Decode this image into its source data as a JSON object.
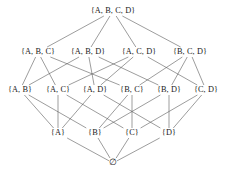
{
  "figure": {
    "background_color": "#ffffff",
    "line_color": "#5a5a5a",
    "text_color": "#1a1a1a",
    "width": 226,
    "height": 172
  },
  "chart_data": {
    "type": "diagram",
    "subtype": "hasse-lattice",
    "base_set": [
      "A",
      "B",
      "C",
      "D"
    ],
    "levels": [
      {
        "rank": 4,
        "y": 11,
        "labels": [
          "{A, B, C, D}"
        ]
      },
      {
        "rank": 3,
        "y": 52,
        "labels": [
          "{A, B, C}",
          "{A, B, D}",
          "{A, C, D}",
          "{B, C, D}"
        ]
      },
      {
        "rank": 2,
        "y": 90,
        "labels": [
          "{A, B}",
          "{A, C}",
          "{A, D}",
          "{B, C}",
          "{B, D}",
          "{C, D}"
        ]
      },
      {
        "rank": 1,
        "y": 133,
        "labels": [
          "{A}",
          "{B}",
          "{C}",
          "{D}"
        ]
      },
      {
        "rank": 0,
        "y": 163,
        "labels": [
          "∅"
        ]
      }
    ],
    "nodes": [
      {
        "id": "ABCD",
        "label": "{A, B, C, D}",
        "rank": 4,
        "x": 113,
        "y": 11
      },
      {
        "id": "ABC",
        "label": "{A, B, C}",
        "rank": 3,
        "x": 38,
        "y": 52
      },
      {
        "id": "ABD",
        "label": "{A, B, D}",
        "rank": 3,
        "x": 88,
        "y": 52
      },
      {
        "id": "ACD",
        "label": "{A, C, D}",
        "rank": 3,
        "x": 139,
        "y": 52
      },
      {
        "id": "BCD",
        "label": "{B, C, D}",
        "rank": 3,
        "x": 190,
        "y": 52
      },
      {
        "id": "AB",
        "label": "{A, B}",
        "rank": 2,
        "x": 20,
        "y": 90
      },
      {
        "id": "AC",
        "label": "{A, C}",
        "rank": 2,
        "x": 58,
        "y": 90
      },
      {
        "id": "AD",
        "label": "{A, D}",
        "rank": 2,
        "x": 95,
        "y": 90
      },
      {
        "id": "BC",
        "label": "{B, C}",
        "rank": 2,
        "x": 132,
        "y": 90
      },
      {
        "id": "BD",
        "label": "{B, D}",
        "rank": 2,
        "x": 169,
        "y": 90
      },
      {
        "id": "CD",
        "label": "{C, D}",
        "rank": 2,
        "x": 206,
        "y": 90
      },
      {
        "id": "A",
        "label": "{A}",
        "rank": 1,
        "x": 58,
        "y": 133
      },
      {
        "id": "B",
        "label": "{B}",
        "rank": 1,
        "x": 95,
        "y": 133
      },
      {
        "id": "C",
        "label": "{C}",
        "rank": 1,
        "x": 132,
        "y": 133
      },
      {
        "id": "D",
        "label": "{D}",
        "rank": 1,
        "x": 169,
        "y": 133
      },
      {
        "id": "EMPTY",
        "label": "∅",
        "rank": 0,
        "x": 113,
        "y": 163
      }
    ],
    "edges": [
      {
        "from": "ABCD",
        "to": "ABC"
      },
      {
        "from": "ABCD",
        "to": "ABD"
      },
      {
        "from": "ABCD",
        "to": "ACD"
      },
      {
        "from": "ABCD",
        "to": "BCD"
      },
      {
        "from": "ABC",
        "to": "AB"
      },
      {
        "from": "ABC",
        "to": "AC"
      },
      {
        "from": "ABC",
        "to": "BC"
      },
      {
        "from": "ABD",
        "to": "AB"
      },
      {
        "from": "ABD",
        "to": "AD"
      },
      {
        "from": "ABD",
        "to": "BD"
      },
      {
        "from": "ACD",
        "to": "AC"
      },
      {
        "from": "ACD",
        "to": "AD"
      },
      {
        "from": "ACD",
        "to": "CD"
      },
      {
        "from": "BCD",
        "to": "BC"
      },
      {
        "from": "BCD",
        "to": "BD"
      },
      {
        "from": "BCD",
        "to": "CD"
      },
      {
        "from": "AB",
        "to": "A"
      },
      {
        "from": "AB",
        "to": "B"
      },
      {
        "from": "AC",
        "to": "A"
      },
      {
        "from": "AC",
        "to": "C"
      },
      {
        "from": "AD",
        "to": "A"
      },
      {
        "from": "AD",
        "to": "D"
      },
      {
        "from": "BC",
        "to": "B"
      },
      {
        "from": "BC",
        "to": "C"
      },
      {
        "from": "BD",
        "to": "B"
      },
      {
        "from": "BD",
        "to": "D"
      },
      {
        "from": "CD",
        "to": "C"
      },
      {
        "from": "CD",
        "to": "D"
      },
      {
        "from": "A",
        "to": "EMPTY"
      },
      {
        "from": "B",
        "to": "EMPTY"
      },
      {
        "from": "C",
        "to": "EMPTY"
      },
      {
        "from": "D",
        "to": "EMPTY"
      }
    ]
  }
}
